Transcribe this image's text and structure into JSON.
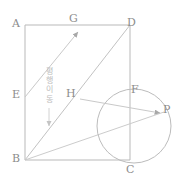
{
  "figure": {
    "title": "",
    "stroke_color": "#b9b9b9",
    "label_color": "#8c8c8c",
    "annotation_color": "#bdbdbd",
    "background": "#ffffff",
    "width": 179,
    "height": 183
  },
  "labels": {
    "a": "A",
    "b": "B",
    "c": "C",
    "d": "D",
    "e": "E",
    "f": "F",
    "g": "G",
    "h": "H",
    "p": "P"
  },
  "annotation": {
    "translation_text": "평행이동",
    "translation_chars": [
      "평",
      "행",
      "이",
      "동"
    ]
  },
  "geometry": {
    "rectangle": {
      "a": [
        25,
        25
      ],
      "b": [
        25,
        160
      ],
      "c": [
        130,
        160
      ],
      "d": [
        130,
        25
      ]
    },
    "points": {
      "e": [
        25,
        96
      ],
      "g": [
        79,
        29
      ],
      "h": [
        80,
        99
      ],
      "f": [
        130,
        96
      ],
      "p": [
        163,
        112
      ]
    },
    "circle": {
      "center": [
        134,
        126
      ],
      "radius": 37
    },
    "segments": [
      {
        "name": "side-ad",
        "from": [
          25,
          25
        ],
        "to": [
          130,
          25
        ]
      },
      {
        "name": "side-ab",
        "from": [
          25,
          25
        ],
        "to": [
          25,
          160
        ]
      },
      {
        "name": "side-bc",
        "from": [
          25,
          160
        ],
        "to": [
          130,
          160
        ]
      },
      {
        "name": "side-dc",
        "from": [
          130,
          25
        ],
        "to": [
          130,
          160
        ]
      },
      {
        "name": "diagonal-bd",
        "from": [
          25,
          160
        ],
        "to": [
          130,
          25
        ]
      },
      {
        "name": "segment-bp",
        "from": [
          25,
          160
        ],
        "to": [
          163,
          112
        ]
      }
    ],
    "arrows": [
      {
        "name": "arrow-e-to-g",
        "from": [
          25,
          96
        ],
        "to": [
          79,
          31
        ]
      },
      {
        "name": "arrow-h-to-p",
        "from": [
          80,
          99
        ],
        "to": [
          161,
          113
        ]
      },
      {
        "name": "arrow-translation-down",
        "from": [
          49,
          110
        ],
        "to": [
          49,
          127
        ]
      }
    ]
  }
}
